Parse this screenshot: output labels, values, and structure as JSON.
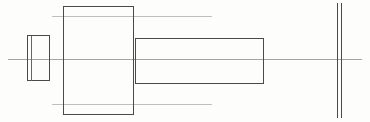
{
  "drawing": {
    "title": "Stepped Shaft Side View",
    "type": "engineering-line-drawing",
    "canvas": {
      "width": 370,
      "height": 122
    },
    "background_color": "#fdfdfc",
    "outline_color": "#4a4a4a",
    "centerline_color": "#9a9a9a",
    "construction_line_color": "#b8b8b8",
    "ghost_text": "",
    "shapes": [
      {
        "name": "left-small-rectangle",
        "kind": "rectangle",
        "x": 27,
        "y": 35,
        "width": 22,
        "height": 45,
        "stroke": "#4a4a4a",
        "stroke_width": 1,
        "inner_edge_x": 31,
        "has_double_left_edge": true
      },
      {
        "name": "flange-rectangle",
        "kind": "rectangle",
        "x": 63,
        "y": 6,
        "width": 70,
        "height": 108,
        "stroke": "#4a4a4a",
        "stroke_width": 1.4
      },
      {
        "name": "shaft-rectangle",
        "kind": "rectangle",
        "x": 135,
        "y": 38,
        "width": 128,
        "height": 45,
        "stroke": "#4a4a4a",
        "stroke_width": 1.4
      },
      {
        "name": "right-double-vertical-line",
        "kind": "double-vertical-line",
        "x1": 337,
        "x2": 341,
        "y_top": 3,
        "y_bottom": 118,
        "stroke": "#4a4a4a",
        "stroke_width": 1.2
      }
    ],
    "axes": [
      {
        "name": "horizontal-centerline",
        "kind": "centerline",
        "x_start": 8,
        "x_end": 362,
        "y": 59,
        "stroke": "#9a9a9a",
        "stroke_width": 0.9
      },
      {
        "name": "upper-construction-line",
        "kind": "construction-line",
        "x_start": 52,
        "x_end": 212,
        "y": 16,
        "stroke": "#b8b8b8",
        "stroke_width": 0.9
      },
      {
        "name": "lower-construction-line",
        "kind": "construction-line",
        "x_start": 52,
        "x_end": 212,
        "y": 104,
        "stroke": "#b8b8b8",
        "stroke_width": 0.9
      }
    ]
  }
}
